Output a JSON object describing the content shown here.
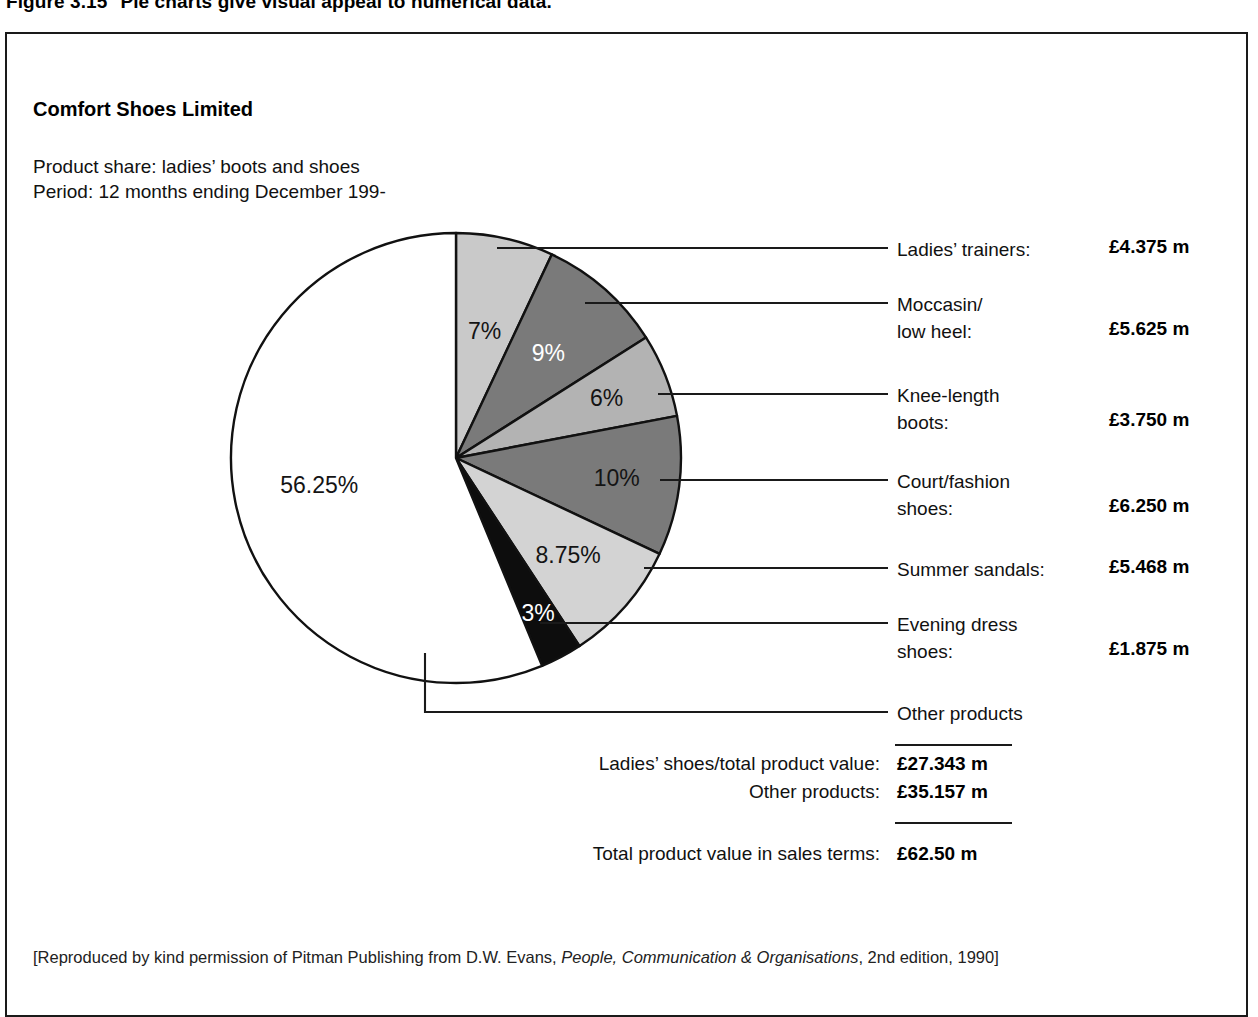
{
  "figure": {
    "number": "Figure 3.15",
    "caption": "Pie charts give visual appeal to numerical data."
  },
  "header": {
    "company": "Comfort Shoes Limited",
    "product_share": "Product share: ladies’ boots and shoes",
    "period": "Period: 12 months ending December 199-"
  },
  "chart_data": {
    "type": "pie",
    "title": "Comfort Shoes Limited",
    "subtitle": "Product share: ladies’ boots and shoes",
    "period": "Period: 12 months ending December 199-",
    "units": "£ m",
    "total": 62.5,
    "legend_position": "right",
    "grid": false,
    "start_angle_deg": 0,
    "direction": "clockwise",
    "labels": [
      "Ladies’ trainers",
      "Moccasin/low heel",
      "Knee-length boots",
      "Court/fashion shoes",
      "Summer sandals",
      "Evening dress shoes",
      "Other products"
    ],
    "values": [
      7,
      9,
      6,
      10,
      8.75,
      3,
      56.25
    ],
    "value_labels": [
      "7%",
      "9%",
      "6%",
      "10%",
      "8.75%",
      "3%",
      "56.25%"
    ],
    "amounts": [
      4.375,
      5.625,
      3.75,
      6.25,
      5.468,
      1.875,
      35.157
    ],
    "amount_labels": [
      "£4.375 m",
      "£5.625 m",
      "£3.750 m",
      "£6.250 m",
      "£5.468 m",
      "£1.875 m",
      ""
    ],
    "slice_fills": [
      "#c9c9c9",
      "#7a7a7a",
      "#b3b3b3",
      "#7a7a7a",
      "#d3d3d3",
      "#0d0d0d",
      "#ffffff"
    ],
    "slice_label_colors": [
      "#141414",
      "#ffffff",
      "#141414",
      "#141414",
      "#141414",
      "#ffffff",
      "#141414"
    ]
  },
  "legend": [
    {
      "name_line1": "Ladies’ trainers:",
      "name_line2": "",
      "value": "£4.375 m"
    },
    {
      "name_line1": "Moccasin/",
      "name_line2": "low heel:",
      "value": "£5.625 m"
    },
    {
      "name_line1": "Knee-length",
      "name_line2": "boots:",
      "value": "£3.750 m"
    },
    {
      "name_line1": "Court/fashion",
      "name_line2": "shoes:",
      "value": "£6.250 m"
    },
    {
      "name_line1": "Summer sandals:",
      "name_line2": "",
      "value": "£5.468 m"
    },
    {
      "name_line1": "Evening dress",
      "name_line2": "shoes:",
      "value": "£1.875 m"
    },
    {
      "name_line1": "Other products",
      "name_line2": "",
      "value": ""
    }
  ],
  "totals": [
    {
      "label": "Ladies’ shoes/total product value:",
      "value": "£27.343 m"
    },
    {
      "label": "Other products:",
      "value": "£35.157 m"
    },
    {
      "label": "Total product value in sales terms:",
      "value": "£62.50 m"
    }
  ],
  "footer": {
    "prefix": "[Reproduced by kind permission of Pitman Publishing from D.W. Evans, ",
    "work_title": "People, Communication & Organisations",
    "suffix": ", 2nd edition, 1990]"
  }
}
